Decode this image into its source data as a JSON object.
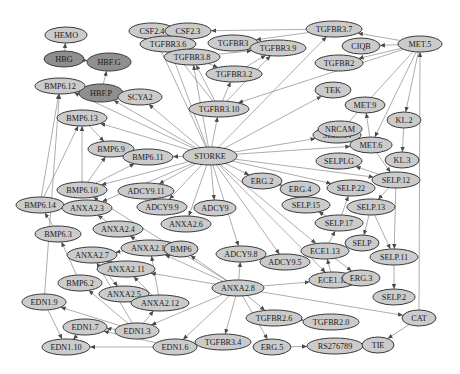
{
  "graph": {
    "title": "",
    "colors": {
      "node_fill": "#cbcbcb",
      "node_fill_dark": "#8f8f8f",
      "node_stroke": "#3a3a3a",
      "edge": "#8a8a8a",
      "background": "#ffffff"
    },
    "nodes": [
      {
        "id": "HEMO",
        "label": "HEMO",
        "x": 66,
        "y": 35,
        "rx": 21,
        "ry": 8,
        "dark": false
      },
      {
        "id": "HBG",
        "label": "HBG",
        "x": 64,
        "y": 59,
        "rx": 20,
        "ry": 8,
        "dark": true
      },
      {
        "id": "HBF.G",
        "label": "HBF.G",
        "x": 109,
        "y": 62,
        "rx": 22,
        "ry": 9,
        "dark": true
      },
      {
        "id": "HBF.P",
        "label": "HBF.P",
        "x": 101,
        "y": 93,
        "rx": 22,
        "ry": 9,
        "dark": true
      },
      {
        "id": "CSF2.4",
        "label": "CSF2.4",
        "x": 152,
        "y": 31,
        "rx": 23,
        "ry": 8,
        "dark": false
      },
      {
        "id": "CSF2.3",
        "label": "CSF2.3",
        "x": 188,
        "y": 31,
        "rx": 23,
        "ry": 8,
        "dark": false
      },
      {
        "id": "TGFBR3.7",
        "label": "TGFBR3.7",
        "x": 334,
        "y": 29,
        "rx": 28,
        "ry": 8,
        "dark": false
      },
      {
        "id": "MET.5",
        "label": "MET.5",
        "x": 420,
        "y": 44,
        "rx": 22,
        "ry": 8,
        "dark": false
      },
      {
        "id": "TGFBR3.6",
        "label": "TGFBR3.6",
        "x": 168,
        "y": 44,
        "rx": 28,
        "ry": 8,
        "dark": false
      },
      {
        "id": "TGFBR3",
        "label": "TGFBR3",
        "x": 233,
        "y": 43,
        "rx": 25,
        "ry": 8,
        "dark": false
      },
      {
        "id": "TGFBR3.9",
        "label": "TGFBR3.9",
        "x": 278,
        "y": 48,
        "rx": 28,
        "ry": 8,
        "dark": false
      },
      {
        "id": "C1QB",
        "label": "CIQB",
        "x": 361,
        "y": 46,
        "rx": 19,
        "ry": 8,
        "dark": false
      },
      {
        "id": "TGFBR2",
        "label": "TGFBR2",
        "x": 339,
        "y": 63,
        "rx": 24,
        "ry": 8,
        "dark": false
      },
      {
        "id": "TGFBR3.8",
        "label": "TGFBR3.8",
        "x": 192,
        "y": 57,
        "rx": 28,
        "ry": 8,
        "dark": false
      },
      {
        "id": "TGFBR3.2",
        "label": "TGFBR3.2",
        "x": 234,
        "y": 74,
        "rx": 28,
        "ry": 8,
        "dark": false
      },
      {
        "id": "TGFBR3.10",
        "label": "TGFBR3.10",
        "x": 219,
        "y": 109,
        "rx": 30,
        "ry": 8,
        "dark": false
      },
      {
        "id": "TEK",
        "label": "TEK",
        "x": 333,
        "y": 90,
        "rx": 18,
        "ry": 8,
        "dark": false
      },
      {
        "id": "SCYA2",
        "label": "SCYA2",
        "x": 140,
        "y": 97,
        "rx": 22,
        "ry": 8,
        "dark": false
      },
      {
        "id": "BMP6.12",
        "label": "BMP6.12",
        "x": 60,
        "y": 86,
        "rx": 25,
        "ry": 8,
        "dark": false
      },
      {
        "id": "BMP6.13",
        "label": "BMP6.13",
        "x": 82,
        "y": 118,
        "rx": 25,
        "ry": 8,
        "dark": false
      },
      {
        "id": "BMP6.9",
        "label": "BMP6.9",
        "x": 111,
        "y": 149,
        "rx": 23,
        "ry": 8,
        "dark": false
      },
      {
        "id": "BMP6.11",
        "label": "BMP6.11",
        "x": 148,
        "y": 157,
        "rx": 25,
        "ry": 8,
        "dark": false
      },
      {
        "id": "STORKE",
        "label": "STORKE",
        "x": 210,
        "y": 156,
        "rx": 27,
        "ry": 9,
        "dark": false
      },
      {
        "id": "SELP.14",
        "label": "SELP.14",
        "x": 337,
        "y": 135,
        "rx": 24,
        "ry": 8,
        "dark": false
      },
      {
        "id": "MET.9",
        "label": "MET.9",
        "x": 365,
        "y": 105,
        "rx": 20,
        "ry": 8,
        "dark": false
      },
      {
        "id": "KL.2",
        "label": "KL.2",
        "x": 404,
        "y": 120,
        "rx": 17,
        "ry": 8,
        "dark": false
      },
      {
        "id": "NRCAM",
        "label": "NRCAM",
        "x": 340,
        "y": 129,
        "rx": 22,
        "ry": 8,
        "dark": false
      },
      {
        "id": "MET.6",
        "label": "MET.6",
        "x": 371,
        "y": 145,
        "rx": 21,
        "ry": 8,
        "dark": false
      },
      {
        "id": "KL.3",
        "label": "KL.3",
        "x": 402,
        "y": 160,
        "rx": 17,
        "ry": 8,
        "dark": false
      },
      {
        "id": "BMP6.10",
        "label": "BMP6.10",
        "x": 82,
        "y": 190,
        "rx": 25,
        "ry": 8,
        "dark": false
      },
      {
        "id": "ADCY9.11",
        "label": "ADCY9.11",
        "x": 146,
        "y": 191,
        "rx": 28,
        "ry": 8,
        "dark": false
      },
      {
        "id": "BMP6.14",
        "label": "BMP6.14",
        "x": 40,
        "y": 205,
        "rx": 24,
        "ry": 8,
        "dark": false
      },
      {
        "id": "ANXA2.3",
        "label": "ANXA2.3",
        "x": 87,
        "y": 208,
        "rx": 25,
        "ry": 8,
        "dark": false
      },
      {
        "id": "SELPLG",
        "label": "SELPLG",
        "x": 339,
        "y": 161,
        "rx": 23,
        "ry": 8,
        "dark": false
      },
      {
        "id": "SELP.12",
        "label": "SELP.12",
        "x": 396,
        "y": 180,
        "rx": 24,
        "ry": 8,
        "dark": false
      },
      {
        "id": "ERG.2",
        "label": "ERG.2",
        "x": 262,
        "y": 181,
        "rx": 20,
        "ry": 8,
        "dark": false
      },
      {
        "id": "ERG.4",
        "label": "ERG.4",
        "x": 300,
        "y": 189,
        "rx": 20,
        "ry": 8,
        "dark": false
      },
      {
        "id": "SELP.22",
        "label": "SELP.22",
        "x": 351,
        "y": 188,
        "rx": 24,
        "ry": 8,
        "dark": false
      },
      {
        "id": "ADCY9.9",
        "label": "ADCY9.9",
        "x": 162,
        "y": 207,
        "rx": 25,
        "ry": 8,
        "dark": false
      },
      {
        "id": "ADCY9",
        "label": "ADCY9",
        "x": 215,
        "y": 208,
        "rx": 21,
        "ry": 8,
        "dark": false
      },
      {
        "id": "ANXA2.6",
        "label": "ANXA2.6",
        "x": 186,
        "y": 224,
        "rx": 25,
        "ry": 8,
        "dark": false
      },
      {
        "id": "SELP.15",
        "label": "SELP.15",
        "x": 306,
        "y": 205,
        "rx": 24,
        "ry": 8,
        "dark": false
      },
      {
        "id": "SELP.13",
        "label": "SELP.13",
        "x": 371,
        "y": 207,
        "rx": 24,
        "ry": 8,
        "dark": false
      },
      {
        "id": "BMP6.3",
        "label": "BMP6.3",
        "x": 58,
        "y": 234,
        "rx": 23,
        "ry": 8,
        "dark": false
      },
      {
        "id": "ANXA2.4",
        "label": "ANXA2.4",
        "x": 118,
        "y": 229,
        "rx": 25,
        "ry": 8,
        "dark": false
      },
      {
        "id": "SELP.17",
        "label": "SELP.17",
        "x": 339,
        "y": 223,
        "rx": 24,
        "ry": 8,
        "dark": false
      },
      {
        "id": "SELP",
        "label": "SELP",
        "x": 362,
        "y": 243,
        "rx": 17,
        "ry": 8,
        "dark": false
      },
      {
        "id": "ANXA2.7",
        "label": "ANXA2.7",
        "x": 92,
        "y": 255,
        "rx": 25,
        "ry": 8,
        "dark": false
      },
      {
        "id": "ANXA2.13",
        "label": "ANXA2.13",
        "x": 150,
        "y": 248,
        "rx": 29,
        "ry": 8,
        "dark": false
      },
      {
        "id": "BMP6",
        "label": "BMP6",
        "x": 181,
        "y": 249,
        "rx": 17,
        "ry": 8,
        "dark": false
      },
      {
        "id": "ADCY9.8",
        "label": "ADCY9.8",
        "x": 241,
        "y": 254,
        "rx": 25,
        "ry": 8,
        "dark": false
      },
      {
        "id": "ADCY9.5",
        "label": "ADCY9.5",
        "x": 285,
        "y": 262,
        "rx": 25,
        "ry": 8,
        "dark": false
      },
      {
        "id": "ECE1.13",
        "label": "ECE1.13",
        "x": 325,
        "y": 251,
        "rx": 24,
        "ry": 8,
        "dark": false
      },
      {
        "id": "SELP.11",
        "label": "SELP.11",
        "x": 394,
        "y": 257,
        "rx": 24,
        "ry": 8,
        "dark": false
      },
      {
        "id": "ANXA2.11",
        "label": "ANXA2.11",
        "x": 126,
        "y": 269,
        "rx": 29,
        "ry": 8,
        "dark": false
      },
      {
        "id": "BMP6.2",
        "label": "BMP6.2",
        "x": 80,
        "y": 283,
        "rx": 22,
        "ry": 8,
        "dark": false
      },
      {
        "id": "ANXA2.8",
        "label": "ANXA2.8",
        "x": 238,
        "y": 288,
        "rx": 26,
        "ry": 8,
        "dark": false
      },
      {
        "id": "ECE1.12",
        "label": "ECE1.12",
        "x": 333,
        "y": 280,
        "rx": 24,
        "ry": 8,
        "dark": false
      },
      {
        "id": "ERG.3",
        "label": "ERG.3",
        "x": 361,
        "y": 278,
        "rx": 19,
        "ry": 8,
        "dark": false
      },
      {
        "id": "ANXA2.5",
        "label": "ANXA2.5",
        "x": 124,
        "y": 294,
        "rx": 25,
        "ry": 8,
        "dark": false
      },
      {
        "id": "EDN1.9",
        "label": "EDN1.9",
        "x": 44,
        "y": 302,
        "rx": 22,
        "ry": 8,
        "dark": false
      },
      {
        "id": "ANXA2.12",
        "label": "ANXA2.12",
        "x": 160,
        "y": 303,
        "rx": 29,
        "ry": 8,
        "dark": false
      },
      {
        "id": "SELP.2",
        "label": "SELP.2",
        "x": 394,
        "y": 297,
        "rx": 21,
        "ry": 8,
        "dark": false
      },
      {
        "id": "TGFBR2.6",
        "label": "TGFBR2.6",
        "x": 274,
        "y": 318,
        "rx": 28,
        "ry": 8,
        "dark": false
      },
      {
        "id": "TGFBR2.0",
        "label": "TGFBR2.0",
        "x": 331,
        "y": 322,
        "rx": 28,
        "ry": 8,
        "dark": false
      },
      {
        "id": "CAT",
        "label": "CAT",
        "x": 419,
        "y": 318,
        "rx": 17,
        "ry": 8,
        "dark": false
      },
      {
        "id": "EDN1.7",
        "label": "EDN1.7",
        "x": 85,
        "y": 327,
        "rx": 22,
        "ry": 8,
        "dark": false
      },
      {
        "id": "EDN1.3",
        "label": "EDN1.3",
        "x": 137,
        "y": 331,
        "rx": 22,
        "ry": 8,
        "dark": false
      },
      {
        "id": "EDN1.10",
        "label": "EDN1.10",
        "x": 66,
        "y": 347,
        "rx": 24,
        "ry": 8,
        "dark": false
      },
      {
        "id": "EDN1.6",
        "label": "EDN1.6",
        "x": 175,
        "y": 347,
        "rx": 22,
        "ry": 8,
        "dark": false
      },
      {
        "id": "TGFBR3.4",
        "label": "TGFBR3.4",
        "x": 223,
        "y": 342,
        "rx": 28,
        "ry": 8,
        "dark": false
      },
      {
        "id": "ERG.5",
        "label": "ERG.5",
        "x": 272,
        "y": 347,
        "rx": 19,
        "ry": 8,
        "dark": false
      },
      {
        "id": "RS276789",
        "label": "RS276789",
        "x": 335,
        "y": 346,
        "rx": 28,
        "ry": 8,
        "dark": false
      },
      {
        "id": "TIE",
        "label": "TIE",
        "x": 378,
        "y": 345,
        "rx": 16,
        "ry": 8,
        "dark": false
      }
    ],
    "edges": [
      [
        "HBG",
        "HEMO"
      ],
      [
        "HBG",
        "HBF.G"
      ],
      [
        "HBF.P",
        "HBF.G"
      ],
      [
        "STORKE",
        "CSF2.4"
      ],
      [
        "STORKE",
        "TGFBR3.6"
      ],
      [
        "STORKE",
        "TGFBR3.8"
      ],
      [
        "STORKE",
        "TGFBR3.10"
      ],
      [
        "STORKE",
        "SCYA2"
      ],
      [
        "STORKE",
        "HBF.P"
      ],
      [
        "STORKE",
        "BMP6.12"
      ],
      [
        "STORKE",
        "BMP6.13"
      ],
      [
        "STORKE",
        "BMP6.11"
      ],
      [
        "STORKE",
        "BMP6.10"
      ],
      [
        "STORKE",
        "ADCY9.11"
      ],
      [
        "STORKE",
        "ADCY9.9"
      ],
      [
        "STORKE",
        "ADCY9"
      ],
      [
        "STORKE",
        "ANXA2.6"
      ],
      [
        "STORKE",
        "ERG.2"
      ],
      [
        "STORKE",
        "SELP.14"
      ],
      [
        "STORKE",
        "TEK"
      ],
      [
        "STORKE",
        "MET.6"
      ],
      [
        "STORKE",
        "SELP.22"
      ],
      [
        "STORKE",
        "ADCY9.8"
      ],
      [
        "STORKE",
        "ADCY9.5"
      ],
      [
        "STORKE",
        "ECE1.13"
      ],
      [
        "STORKE",
        "ECE1.12"
      ],
      [
        "STORKE",
        "SELP.12"
      ],
      [
        "STORKE",
        "TGFBR3.7"
      ],
      [
        "STORKE",
        "ANXA2.3"
      ],
      [
        "TGFBR3.7",
        "CSF2.3"
      ],
      [
        "TGFBR3.7",
        "TGFBR3"
      ],
      [
        "MET.5",
        "TGFBR3.7"
      ],
      [
        "MET.5",
        "C1QB"
      ],
      [
        "MET.5",
        "TGFBR2"
      ],
      [
        "MET.5",
        "KL.2"
      ],
      [
        "MET.5",
        "MET.6"
      ],
      [
        "MET.5",
        "TGFBR3.10"
      ],
      [
        "MET.5",
        "SELP.14"
      ],
      [
        "TGFBR3.8",
        "TGFBR3.9"
      ],
      [
        "TGFBR3.8",
        "TGFBR3.2"
      ],
      [
        "TGFBR3.2",
        "TGFBR3.9"
      ],
      [
        "TGFBR3.10",
        "TGFBR3.8"
      ],
      [
        "TGFBR3.10",
        "TGFBR3.2"
      ],
      [
        "TGFBR3.10",
        "TGFBR3.9"
      ],
      [
        "TGFBR3.10",
        "TGFBR3.6"
      ],
      [
        "MET.6",
        "MET.9"
      ],
      [
        "NRCAM",
        "MET.6"
      ],
      [
        "KL.2",
        "KL.3"
      ],
      [
        "MET.6",
        "SELP.12"
      ],
      [
        "SELP.12",
        "SELPLG"
      ],
      [
        "SELP.12",
        "SELP.13"
      ],
      [
        "SELP.12",
        "SELP.11"
      ],
      [
        "SELP.13",
        "SELP"
      ],
      [
        "SELP.13",
        "SELP.11"
      ],
      [
        "SELP.11",
        "SELP.2"
      ],
      [
        "SELP.17",
        "SELP.22"
      ],
      [
        "SELP.17",
        "SELP.15"
      ],
      [
        "ECE1.13",
        "SELP.17"
      ],
      [
        "ERG.2",
        "ERG.4"
      ],
      [
        "ECE1.12",
        "ECE1.13"
      ],
      [
        "ECE1.13",
        "ERG.3"
      ],
      [
        "BMP6.13",
        "BMP6.9"
      ],
      [
        "BMP6.10",
        "BMP6.13"
      ],
      [
        "BMP6.10",
        "BMP6.9"
      ],
      [
        "BMP6.10",
        "BMP6.11"
      ],
      [
        "BMP6.14",
        "BMP6.12"
      ],
      [
        "BMP6.14",
        "BMP6.13"
      ],
      [
        "BMP6.3",
        "BMP6.14"
      ],
      [
        "ANXA2.4",
        "ANXA2.3"
      ],
      [
        "ANXA2.13",
        "ANXA2.4"
      ],
      [
        "ANXA2.13",
        "ANXA2.7"
      ],
      [
        "ANXA2.11",
        "ANXA2.7"
      ],
      [
        "ANXA2.12",
        "ANXA2.13"
      ],
      [
        "ANXA2.12",
        "ANXA2.11"
      ],
      [
        "ANXA2.12",
        "ANXA2.5"
      ],
      [
        "ANXA2.7",
        "ANXA2.5"
      ],
      [
        "ANXA2.8",
        "ANXA2.13"
      ],
      [
        "ANXA2.8",
        "BMP6"
      ],
      [
        "ANXA2.8",
        "ADCY9.8"
      ],
      [
        "ANXA2.8",
        "ECE1.12"
      ],
      [
        "ANXA2.8",
        "TGFBR2.6"
      ],
      [
        "ANXA2.8",
        "TGFBR3.4"
      ],
      [
        "ANXA2.8",
        "ERG.5"
      ],
      [
        "ANXA2.8",
        "EDN1.6"
      ],
      [
        "ANXA2.8",
        "EDN1.3"
      ],
      [
        "ANXA2.8",
        "CAT"
      ],
      [
        "ANXA2.8",
        "ANXA2.11"
      ],
      [
        "ANXA2.8",
        "BMP6.10"
      ],
      [
        "TGFBR2.6",
        "TGFBR2.0"
      ],
      [
        "ERG.5",
        "RS276789"
      ],
      [
        "CAT",
        "TIE"
      ],
      [
        "CAT",
        "MET.5"
      ],
      [
        "EDN1.3",
        "EDN1.7"
      ],
      [
        "EDN1.3",
        "EDN1.9"
      ],
      [
        "EDN1.3",
        "BMP6.2"
      ],
      [
        "EDN1.3",
        "ANXA2.12"
      ],
      [
        "EDN1.3",
        "ANXA2.7"
      ],
      [
        "EDN1.6",
        "EDN1.10"
      ],
      [
        "EDN1.6",
        "EDN1.7"
      ],
      [
        "EDN1.9",
        "EDN1.10"
      ],
      [
        "EDN1.7",
        "EDN1.10"
      ],
      [
        "BMP6.2",
        "BMP6.3"
      ],
      [
        "EDN1.9",
        "BMP6.12"
      ]
    ]
  }
}
